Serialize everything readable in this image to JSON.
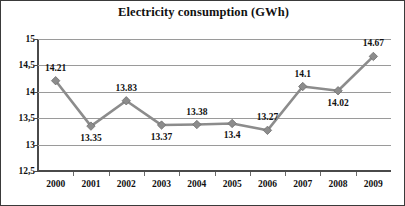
{
  "chart_data": {
    "type": "line",
    "title": "Electricity consumption (GWh)",
    "xlabel": "",
    "ylabel": "",
    "categories": [
      "2000",
      "2001",
      "2002",
      "2003",
      "2004",
      "2005",
      "2006",
      "2007",
      "2008",
      "2009"
    ],
    "values": [
      14.21,
      13.35,
      13.83,
      13.37,
      13.38,
      13.4,
      13.27,
      14.1,
      14.02,
      14.67
    ],
    "data_labels": [
      "14.21",
      "13.35",
      "13.83",
      "13.37",
      "13.38",
      "13.4",
      "13.27",
      "14.1",
      "14.02",
      "14.67"
    ],
    "data_label_positions": [
      "above",
      "below",
      "above",
      "below",
      "above",
      "below",
      "above",
      "above",
      "below",
      "above"
    ],
    "ylim": [
      12.5,
      15
    ],
    "ytick_values": [
      15,
      14.5,
      14,
      13.5,
      13,
      12.5
    ],
    "ytick_labels": [
      "15",
      "14,5",
      "14",
      "13,5",
      "13",
      "12,5"
    ],
    "grid": true,
    "legend": "none",
    "series_color": "#8c8c8c",
    "marker": "diamond",
    "gridline_color": "#9a9a9a",
    "axis_color": "#4a4a4a",
    "background": "#ffffff"
  }
}
